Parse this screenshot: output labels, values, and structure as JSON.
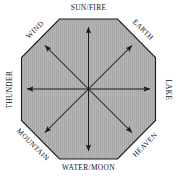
{
  "diagram": {
    "type": "octagon-compass",
    "shape": {
      "sides": 8,
      "fill_color": "#b3b3b3",
      "stroke_color": "#1a1a1a",
      "texture": "vertical-hatch",
      "center_x": 88.5,
      "center_y": 89
    },
    "arrow_color": "#1a1a1a",
    "arrow_count": 8,
    "labels": {
      "north": "SUN/FIRE",
      "northeast": "EARTH",
      "east": "LAKE",
      "southeast": "HEAVEN",
      "south": "WATER/MOON",
      "southwest": "MOUNTAIN",
      "west": "THUNDER",
      "northwest": "WIND"
    },
    "directions": [
      {
        "key": "north",
        "label": "SUN/FIRE",
        "angle_deg": 90
      },
      {
        "key": "northeast",
        "label": "EARTH",
        "angle_deg": 45
      },
      {
        "key": "east",
        "label": "LAKE",
        "angle_deg": 0
      },
      {
        "key": "southeast",
        "label": "HEAVEN",
        "angle_deg": -45
      },
      {
        "key": "south",
        "label": "WATER/MOON",
        "angle_deg": -90
      },
      {
        "key": "southwest",
        "label": "MOUNTAIN",
        "angle_deg": -135
      },
      {
        "key": "west",
        "label": "THUNDER",
        "angle_deg": 180
      },
      {
        "key": "northwest",
        "label": "WIND",
        "angle_deg": 135
      }
    ]
  }
}
